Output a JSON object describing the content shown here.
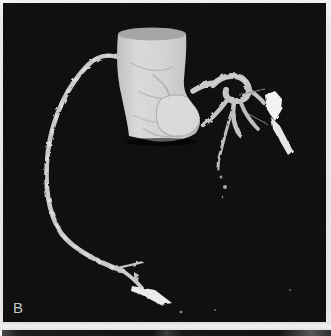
{
  "figure": {
    "panel_label": "B"
  },
  "colors": {
    "page_background": "#e9e9e9",
    "panel_background": "#0a0a0a",
    "aorta_body": "#d4d4d4",
    "aorta_cap": "#a6a6a6",
    "aorta_root_bulge": "#dadada",
    "vessel": "#d2d2d2",
    "vessel_dim": "#bdbdbd",
    "branch": "#c6c6c6",
    "clip_bright": "#f2f2f2",
    "terminal_blob": "#ebebeb",
    "wire": "#8a8a8a",
    "speck": "#9a9a9a",
    "label": "#c3cac9",
    "next_panel_strip": "#1a1a1a"
  }
}
